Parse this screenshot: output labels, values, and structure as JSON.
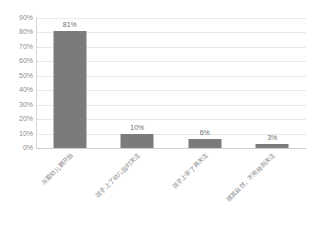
{
  "chart_data": {
    "type": "bar",
    "title": "",
    "xlabel": "",
    "ylabel": "",
    "categories": [
      "从婴幼儿期开始",
      "孩子上了幼儿园时关注",
      "孩子上学了再关注",
      "顺其自然，不用特别关注"
    ],
    "values": [
      81,
      10,
      6,
      3
    ],
    "value_labels": [
      "81%",
      "10%",
      "6%",
      "3%"
    ],
    "ylim": [
      0,
      90
    ],
    "ytick_labels": [
      "90%",
      "80%",
      "70%",
      "60%",
      "50%",
      "40%",
      "30%",
      "20%",
      "10%",
      "0%"
    ],
    "ytick_values": [
      90,
      80,
      70,
      60,
      50,
      40,
      30,
      20,
      10,
      0
    ],
    "grid": true,
    "legend": false,
    "colors": {
      "bar": "#7b7b7b",
      "gridline": "#e9e9e9",
      "axis": "#d0d0d0",
      "tick_text": "#8d8d8d",
      "label_text": "#8a8a8a",
      "value_text": "#6f6f6f",
      "background": "#ffffff"
    }
  }
}
